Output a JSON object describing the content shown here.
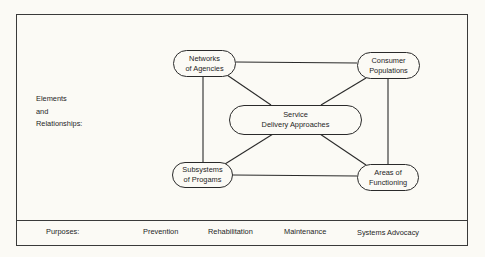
{
  "diagram": {
    "section_label_lines": [
      "Elements",
      "and",
      "Relationships:"
    ],
    "nodes": {
      "networks": {
        "line1": "Networks",
        "line2": "of Agencies"
      },
      "consumer": {
        "line1": "Consumer",
        "line2": "Populations"
      },
      "center": {
        "line1": "Service",
        "line2": "Delivery Approaches"
      },
      "subsystems": {
        "line1": "Subsystems",
        "line2": "of Progams"
      },
      "areas": {
        "line1": "Areas of",
        "line2": "Functioning"
      }
    },
    "edges": [
      [
        "networks",
        "consumer"
      ],
      [
        "subsystems",
        "areas"
      ],
      [
        "networks",
        "subsystems"
      ],
      [
        "consumer",
        "areas"
      ],
      [
        "networks",
        "center"
      ],
      [
        "consumer",
        "center"
      ],
      [
        "center",
        "subsystems"
      ],
      [
        "center",
        "areas"
      ]
    ]
  },
  "purposes": {
    "label": "Purposes:",
    "items": [
      "Prevention",
      "Rehabilitation",
      "Maintenance",
      "Systems Advocacy"
    ]
  }
}
